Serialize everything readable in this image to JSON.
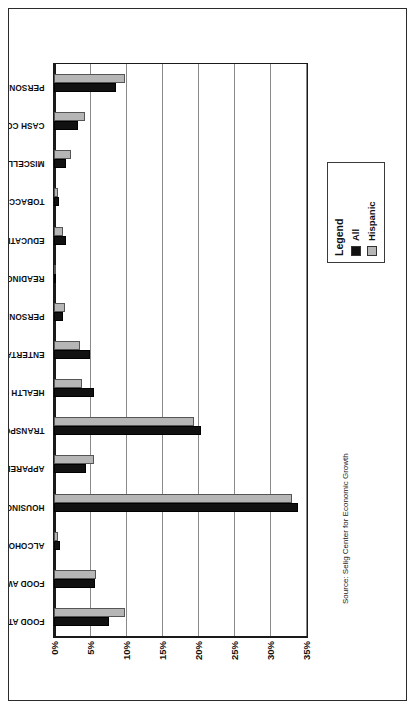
{
  "figure": {
    "source_note": "Source: Selig Center for Economic Growth"
  },
  "legend": {
    "title": "Legend",
    "entries": [
      {
        "label": "All",
        "color": "#111111",
        "swatch": "black-swatch"
      },
      {
        "label": "Hispanic",
        "color": "#b6b6b6",
        "swatch": "gray-swatch"
      }
    ]
  },
  "chart_data": {
    "type": "bar",
    "title": "",
    "subtitle": "",
    "xlabel": "",
    "ylabel": "",
    "orientation": "vertical-rotated-90",
    "grid": true,
    "legend_position": "bottom-right",
    "ylim": [
      0,
      35
    ],
    "ytick_labels": [
      "0%",
      "5%",
      "10%",
      "15%",
      "20%",
      "25%",
      "30%",
      "35%"
    ],
    "ytick_values": [
      0,
      5,
      10,
      15,
      20,
      25,
      30,
      35
    ],
    "categories": [
      "FOOD AT HOME",
      "FOOD AWAY FROM HOME",
      "ALCOHOLIC BEVERAGES",
      "HOUSING",
      "APPAREL & SERVICES",
      "TRANSPORTATION",
      "HEALTH CARE",
      "ENTERTAINMENT",
      "PERSONAL CARE PRODUCTS & SERVICES",
      "READING",
      "EDUCATION",
      "TOBACCO PRODUCTS & SMOKING SUPPLIES",
      "MISCELLANEOUS",
      "CASH CONTRIBUTIONS",
      "PERSONAL INSURANCE & PENSIONS"
    ],
    "series": [
      {
        "name": "All",
        "color": "#111111",
        "values": [
          7.7,
          5.7,
          0.9,
          33.9,
          4.4,
          20.4,
          5.5,
          5.0,
          1.2,
          0.3,
          1.6,
          0.7,
          1.7,
          3.3,
          8.6
        ]
      },
      {
        "name": "Hispanic",
        "color": "#b6b6b6",
        "values": [
          9.8,
          5.9,
          0.6,
          33.1,
          5.5,
          19.5,
          3.9,
          3.6,
          1.5,
          0.2,
          1.2,
          0.6,
          2.3,
          4.3,
          9.9
        ]
      }
    ]
  }
}
